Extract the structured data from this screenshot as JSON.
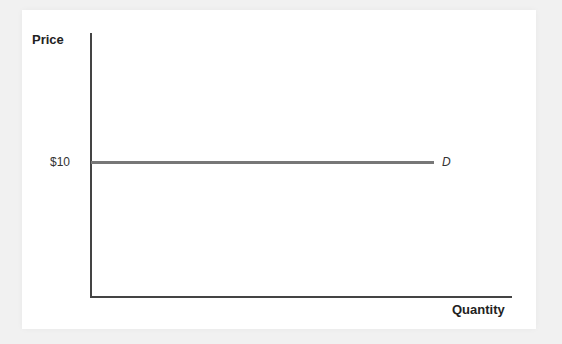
{
  "chart_data": {
    "type": "line",
    "title": "",
    "xlabel": "Quantity",
    "ylabel": "Price",
    "y_ticks": [
      "$10"
    ],
    "series": [
      {
        "name": "D",
        "y": 10,
        "x_start": 0,
        "x_end": null,
        "style": "horizontal",
        "color": "#777777"
      }
    ],
    "grid": false,
    "legend": "inline label at line end"
  },
  "labels": {
    "y_axis": "Price",
    "x_axis": "Quantity",
    "price_tick": "$10",
    "demand_curve": "D"
  },
  "colors": {
    "background": "#f1f1f1",
    "panel": "#ffffff",
    "axis": "#444444",
    "demand_line": "#777777"
  }
}
